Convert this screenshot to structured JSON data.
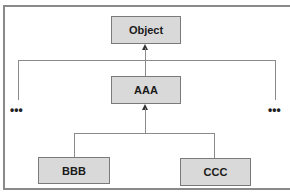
{
  "diagram": {
    "type": "class-inheritance-hierarchy",
    "nodes": {
      "object": {
        "label": "Object"
      },
      "aaa": {
        "label": "AAA"
      },
      "bbb": {
        "label": "BBB"
      },
      "ccc": {
        "label": "CCC"
      }
    },
    "ellipsis_left": "•••",
    "ellipsis_right": "•••",
    "edges": [
      {
        "from": "AAA",
        "to": "Object",
        "style": "arrow"
      },
      {
        "from": "BBB",
        "to": "AAA",
        "style": "arrow"
      },
      {
        "from": "CCC",
        "to": "AAA",
        "style": "arrow"
      },
      {
        "from": "left-siblings",
        "to": "Object",
        "style": "line"
      },
      {
        "from": "right-siblings",
        "to": "Object",
        "style": "line"
      }
    ],
    "colors": {
      "node_fill": "#d9d9d9",
      "node_border": "#7a7a7a",
      "line": "#8a8a8a",
      "arrowhead": "#333333"
    }
  }
}
